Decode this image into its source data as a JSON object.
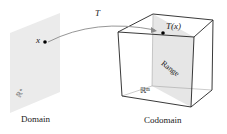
{
  "diagram": {
    "mapping_label": "T",
    "point_label": "x",
    "image_label": "T(x)",
    "domain_space": "ℝⁿ",
    "codomain_space": "ℝᵐ",
    "range_label": "Range",
    "domain_caption": "Domain",
    "codomain_caption": "Codomain"
  },
  "colors": {
    "plane_fill": "#ebebeb",
    "cube_edge": "#222222",
    "arrow": "#8a8a8a",
    "point": "#000000"
  }
}
